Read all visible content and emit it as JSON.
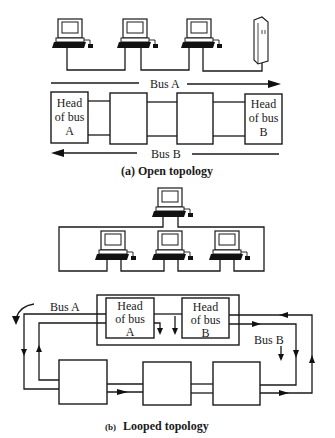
{
  "diagram": {
    "colors": {
      "ink": "#1a1a1a",
      "background": "#ffffff"
    },
    "open_topology": {
      "caption": "(a) Open topology",
      "bus_a_label": "Bus A",
      "bus_b_label": "Bus B",
      "head_a": {
        "line1": "Head",
        "line2": "of bus",
        "line3": "A"
      },
      "head_b": {
        "line1": "Head",
        "line2": "of bus",
        "line3": "B"
      },
      "workstations": [
        "workstation",
        "workstation",
        "workstation"
      ],
      "server": "server-tower"
    },
    "looped_topology": {
      "caption_prefix": "(b)",
      "caption": "Looped topology",
      "bus_a_label": "Bus A",
      "bus_b_label": "Bus B",
      "head_a": {
        "line1": "Head",
        "line2": "of bus",
        "line3": "A"
      },
      "head_b": {
        "line1": "Head",
        "line2": "of bus",
        "line3": "B"
      },
      "workstations": [
        "workstation",
        "workstation",
        "workstation",
        "workstation"
      ]
    }
  }
}
